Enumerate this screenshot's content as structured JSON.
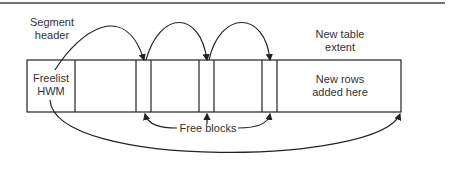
{
  "labels": {
    "segment_header": [
      "Segment",
      "header"
    ],
    "freelist_hwm": [
      "Freelist",
      "HWM"
    ],
    "new_table_extent": [
      "New table",
      "extent"
    ],
    "new_rows": [
      "New rows",
      "added here"
    ],
    "free_blocks": "Free blocks"
  },
  "diagram": {
    "table_box": {
      "x": 27,
      "y": 60,
      "w": 374,
      "h": 52
    },
    "dividers_x": [
      75,
      136,
      151,
      199,
      214,
      262,
      277
    ],
    "colors": {
      "line": "#222222",
      "text": "#333333",
      "background": "#ffffff"
    }
  }
}
